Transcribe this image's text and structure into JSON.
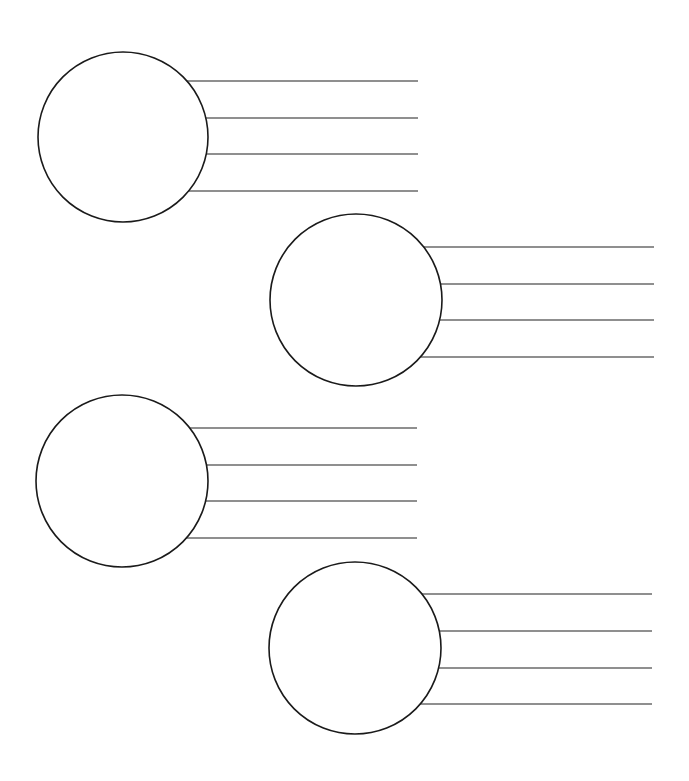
{
  "canvas": {
    "width": 689,
    "height": 781,
    "background": "#ffffff"
  },
  "style": {
    "circle_stroke": "#1a1a1a",
    "circle_stroke_width": 1.6,
    "line_stroke": "#6a6a6a",
    "line_stroke_width": 1.3
  },
  "organizers": [
    {
      "id": 1,
      "circle": {
        "cx": 123,
        "cy": 137,
        "r": 85
      },
      "line_end_x": 418,
      "lines_y": [
        81,
        118,
        154,
        191
      ]
    },
    {
      "id": 2,
      "circle": {
        "cx": 356,
        "cy": 300,
        "r": 86
      },
      "line_end_x": 654,
      "lines_y": [
        247,
        284,
        320,
        357
      ]
    },
    {
      "id": 3,
      "circle": {
        "cx": 122,
        "cy": 481,
        "r": 86
      },
      "line_end_x": 417,
      "lines_y": [
        428,
        465,
        501,
        538
      ]
    },
    {
      "id": 4,
      "circle": {
        "cx": 355,
        "cy": 648,
        "r": 86
      },
      "line_end_x": 652,
      "lines_y": [
        594,
        631,
        668,
        704
      ]
    }
  ]
}
